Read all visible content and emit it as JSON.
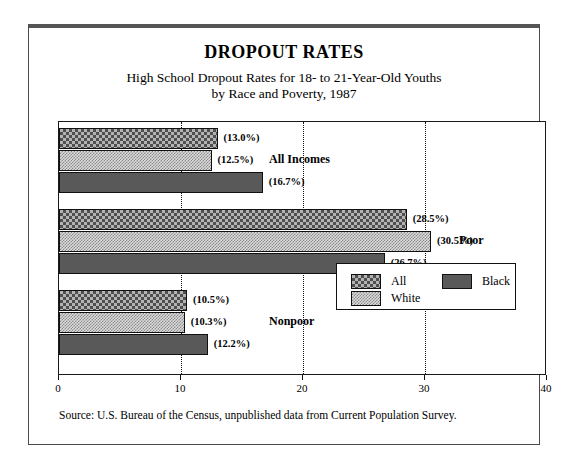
{
  "title": "DROPOUT RATES",
  "subtitle_line1": "High School Dropout Rates for 18- to 21-Year-Old Youths",
  "subtitle_line2": "by Race and Poverty, 1987",
  "source": "Source: U.S. Bureau of the Census, unpublished data from Current Population Survey.",
  "axis": {
    "ticks": [
      "0",
      "10",
      "20",
      "30",
      "40"
    ],
    "min": 0,
    "max": 40
  },
  "groups": [
    {
      "label": "All Incomes"
    },
    {
      "label": "Poor"
    },
    {
      "label": "Nonpoor"
    }
  ],
  "legend": {
    "all_label": "All",
    "white_label": "White",
    "black_label": "Black"
  },
  "bars": [
    {
      "value_label": "(13.0%)",
      "value": 13.0,
      "group": "All Incomes",
      "series": "All"
    },
    {
      "value_label": "(12.5%)",
      "value": 12.5,
      "group": "All Incomes",
      "series": "White"
    },
    {
      "value_label": "(16.7%)",
      "value": 16.7,
      "group": "All Incomes",
      "series": "Black"
    },
    {
      "value_label": "(28.5%)",
      "value": 28.5,
      "group": "Poor",
      "series": "All"
    },
    {
      "value_label": "(30.5%)",
      "value": 30.5,
      "group": "Poor",
      "series": "White"
    },
    {
      "value_label": "(26.7%)",
      "value": 26.7,
      "group": "Poor",
      "series": "Black"
    },
    {
      "value_label": "(10.5%)",
      "value": 10.5,
      "group": "Nonpoor",
      "series": "All"
    },
    {
      "value_label": "(10.3%)",
      "value": 10.3,
      "group": "Nonpoor",
      "series": "White"
    },
    {
      "value_label": "(12.2%)",
      "value": 12.2,
      "group": "Nonpoor",
      "series": "Black"
    }
  ],
  "colors": {
    "all_pattern": "#b3b3b3",
    "white_pattern": "#dcdcdc",
    "black_solid": "#595959",
    "frame": "#4a4a4a",
    "axis": "#1a1a1a"
  },
  "chart_data": {
    "type": "bar",
    "orientation": "horizontal",
    "title": "DROPOUT RATES",
    "subtitle": "High School Dropout Rates for 18- to 21-Year-Old Youths by Race and Poverty, 1987",
    "xlabel": "",
    "ylabel": "",
    "xlim": [
      0,
      40
    ],
    "xticks": [
      0,
      10,
      20,
      30,
      40
    ],
    "grid": "vertical-dotted",
    "legend_position": "inside-bottom-right",
    "categories": [
      "All Incomes",
      "Poor",
      "Nonpoor"
    ],
    "series": [
      {
        "name": "All",
        "values": [
          13.0,
          28.5,
          10.5
        ]
      },
      {
        "name": "White",
        "values": [
          12.5,
          30.5,
          10.3
        ]
      },
      {
        "name": "Black",
        "values": [
          16.7,
          26.7,
          12.2
        ]
      }
    ],
    "annotations": [
      "(13.0%)",
      "(12.5%)",
      "(16.7%)",
      "(28.5%)",
      "(30.5%)",
      "(26.7%)",
      "(10.5%)",
      "(10.3%)",
      "(12.2%)"
    ],
    "source": "Source: U.S. Bureau of the Census, unpublished data from Current Population Survey."
  }
}
